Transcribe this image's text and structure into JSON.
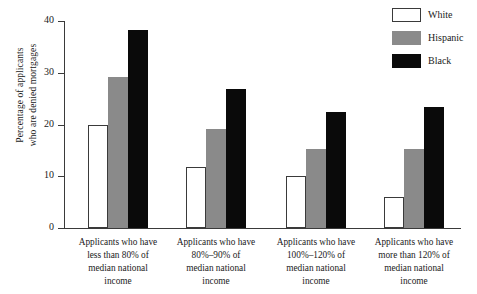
{
  "chart_data": {
    "type": "bar",
    "title": "",
    "subtitle": "",
    "xlabel": "",
    "ylabel_lines": [
      "Percentage of applicants",
      "who are denied mortgages"
    ],
    "ylim": [
      0,
      40
    ],
    "yticks": [
      0,
      10,
      20,
      30,
      40
    ],
    "ytick_labels": [
      "0",
      "10",
      "20",
      "30",
      "40"
    ],
    "grid": false,
    "legend_position": "top-right",
    "categories": [
      "Applicants who have less than 80% of median national income",
      "Applicants who have 80%–90% of median national income",
      "Applicants who have 100%–120% of median national income",
      "Applicants who have more than 120% of median national income"
    ],
    "category_label_lines": [
      [
        "Applicants who have",
        "less than 80% of",
        "median national",
        "income"
      ],
      [
        "Applicants who have",
        "80%–90% of",
        "median national",
        "income"
      ],
      [
        "Applicants who have",
        "100%–120% of",
        "median national",
        "income"
      ],
      [
        "Applicants who have",
        "more than 120% of",
        "median national",
        "income"
      ]
    ],
    "series": [
      {
        "name": "White",
        "color": "#ffffff",
        "values": [
          20.0,
          11.7,
          10.1,
          6.0
        ]
      },
      {
        "name": "Hispanic",
        "color": "#8a8a8a",
        "values": [
          29.1,
          19.1,
          15.2,
          15.2
        ]
      },
      {
        "name": "Black",
        "color": "#0a0a0a",
        "values": [
          38.2,
          26.8,
          22.5,
          23.3
        ]
      }
    ]
  },
  "legend": {
    "items": [
      {
        "label": "White",
        "swatch": "white-swatch"
      },
      {
        "label": "Hispanic",
        "swatch": "gray-swatch"
      },
      {
        "label": "Black",
        "swatch": "black-swatch"
      }
    ]
  },
  "axis": {
    "y_title_line1": "Percentage of applicants",
    "y_title_line2": "who are denied mortgages",
    "y_tick_0": "0",
    "y_tick_1": "10",
    "y_tick_2": "20",
    "y_tick_3": "30",
    "y_tick_4": "40"
  },
  "colors": {
    "axis": "#3a3a3a",
    "text": "#1a1a1a",
    "series_white": "#ffffff",
    "series_gray": "#8a8a8a",
    "series_black": "#0a0a0a",
    "background": "#ffffff"
  }
}
